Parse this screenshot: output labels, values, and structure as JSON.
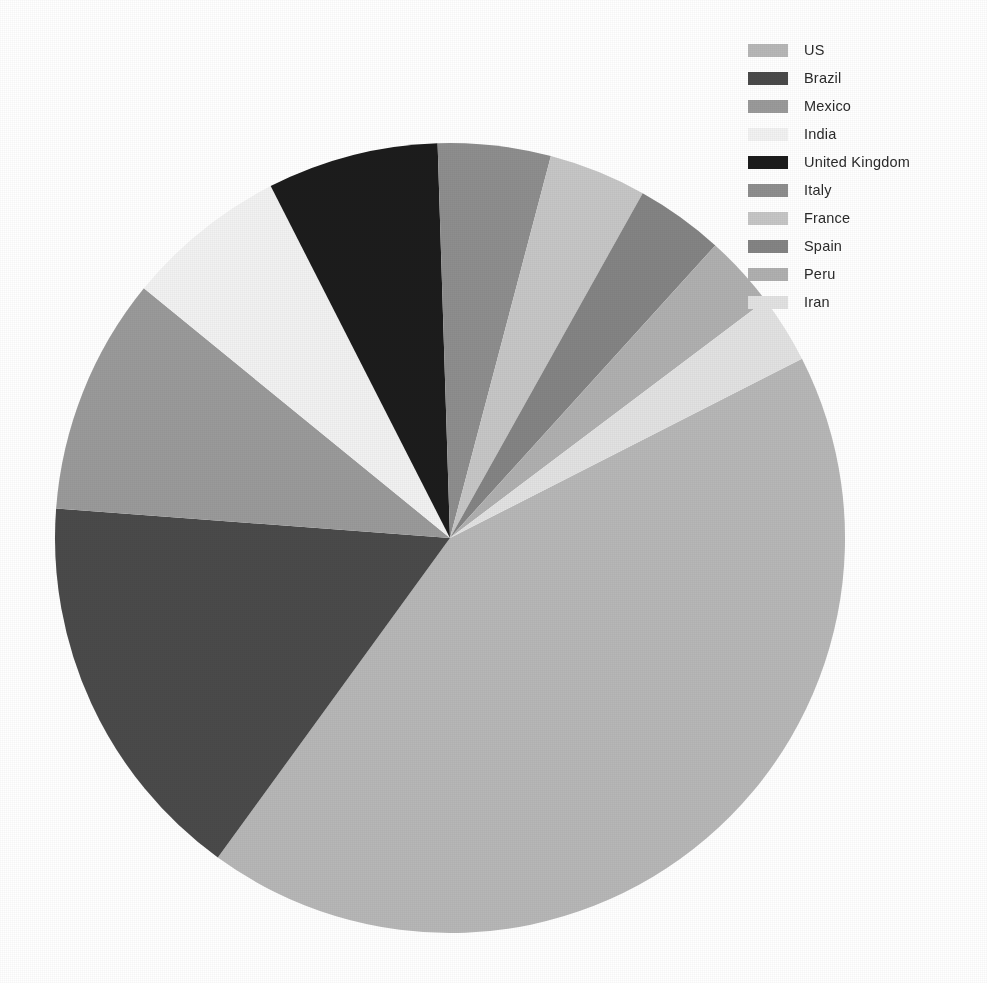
{
  "chart_data": {
    "type": "pie",
    "title": "",
    "subtitle": "",
    "xlabel": "",
    "ylabel": "",
    "legend_position": "top-right",
    "grid": false,
    "start_angle_deg": -27,
    "direction": "clockwise",
    "center": {
      "x": 450,
      "y": 538
    },
    "radius": 395,
    "labels": [
      "US",
      "Brazil",
      "Mexico",
      "India",
      "United Kingdom",
      "Italy",
      "France",
      "Spain",
      "Peru",
      "Iran"
    ],
    "values": [
      42.5,
      16.2,
      9.7,
      6.6,
      7.0,
      4.6,
      4.0,
      3.6,
      3.0,
      2.8
    ],
    "percentages": [
      42.5,
      16.2,
      9.7,
      6.6,
      7.0,
      4.6,
      4.0,
      3.6,
      3.0,
      2.8
    ],
    "angles_deg": [
      153.0,
      58.3,
      34.9,
      23.8,
      25.2,
      16.6,
      14.4,
      13.0,
      10.8,
      10.0
    ],
    "colors": [
      "#b7b7b7",
      "#4a4a4a",
      "#9a9a9a",
      "#f2f2f2",
      "#1c1c1c",
      "#8e8e8e",
      "#c6c6c6",
      "#848484",
      "#b0b0b0",
      "#e2e2e2"
    ],
    "slices": [
      {
        "label": "US",
        "value": 42.5,
        "color": "#b7b7b7",
        "angle_deg": 153.0
      },
      {
        "label": "Brazil",
        "value": 16.2,
        "color": "#4a4a4a",
        "angle_deg": 58.3
      },
      {
        "label": "Mexico",
        "value": 9.7,
        "color": "#9a9a9a",
        "angle_deg": 34.9
      },
      {
        "label": "India",
        "value": 6.6,
        "color": "#f2f2f2",
        "angle_deg": 23.8
      },
      {
        "label": "United Kingdom",
        "value": 7.0,
        "color": "#1c1c1c",
        "angle_deg": 25.2
      },
      {
        "label": "Italy",
        "value": 4.6,
        "color": "#8e8e8e",
        "angle_deg": 16.6
      },
      {
        "label": "France",
        "value": 4.0,
        "color": "#c6c6c6",
        "angle_deg": 14.4
      },
      {
        "label": "Spain",
        "value": 3.6,
        "color": "#848484",
        "angle_deg": 13.0
      },
      {
        "label": "Peru",
        "value": 3.0,
        "color": "#b0b0b0",
        "angle_deg": 10.8
      },
      {
        "label": "Iran",
        "value": 2.8,
        "color": "#e2e2e2",
        "angle_deg": 10.0
      }
    ]
  },
  "legend": {
    "items": [
      {
        "label": "US",
        "color": "#b7b7b7"
      },
      {
        "label": "Brazil",
        "color": "#4a4a4a"
      },
      {
        "label": "Mexico",
        "color": "#9a9a9a"
      },
      {
        "label": "India",
        "color": "#f2f2f2"
      },
      {
        "label": "United Kingdom",
        "color": "#1c1c1c"
      },
      {
        "label": "Italy",
        "color": "#8e8e8e"
      },
      {
        "label": "France",
        "color": "#c6c6c6"
      },
      {
        "label": "Spain",
        "color": "#848484"
      },
      {
        "label": "Peru",
        "color": "#b0b0b0"
      },
      {
        "label": "Iran",
        "color": "#e2e2e2"
      }
    ]
  },
  "canvas": {
    "background": "#ffffff",
    "width": 987,
    "height": 983
  }
}
